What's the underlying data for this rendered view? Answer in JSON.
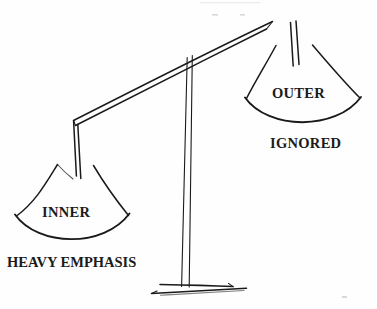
{
  "diagram": {
    "type": "hand-drawn-line-diagram",
    "background_color": "#fefefe",
    "ink_color": "#1a1a1a",
    "labels": {
      "inner": "INNER",
      "outer": "OUTER",
      "ignored": "IGNORED",
      "heavy_emphasis": "HEAVY EMPHASIS"
    },
    "parts": {
      "beam": "balance-beam",
      "pillar": "center-pillar",
      "base": "base-plate",
      "left_pan": "left-pan-cone",
      "right_pan": "right-pan-cone",
      "left_strings": "left-pan-strings",
      "right_strings": "right-pan-strings"
    },
    "state": {
      "tilt": "left-side-down",
      "left_pan_weight": "heavy",
      "right_pan_weight": "light"
    }
  }
}
